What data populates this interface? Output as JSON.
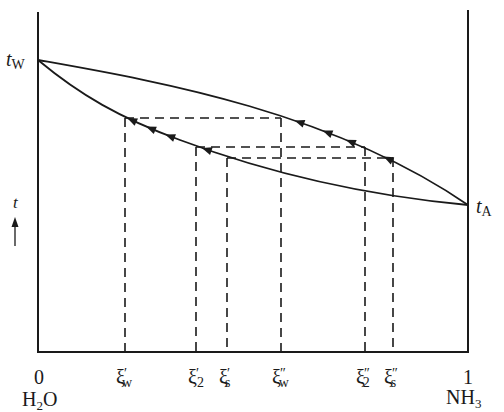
{
  "diagram": {
    "type": "temperature-composition phase diagram",
    "y_axis": {
      "symbol": "t",
      "direction": "increasing-up"
    },
    "left_end": {
      "value_label": "0",
      "component": "H",
      "component_sub": "2",
      "component_tail": "O",
      "temp_label": "t",
      "temp_sub": "W"
    },
    "right_end": {
      "value_label": "1",
      "component": "NH",
      "component_sub": "3",
      "temp_label": "t",
      "temp_sub": "A"
    },
    "curves": [
      {
        "name": "dew-point-curve",
        "position": "upper",
        "flow_direction": "toward-left"
      },
      {
        "name": "boiling-point-curve",
        "position": "lower",
        "flow_direction": "toward-left"
      }
    ],
    "tie_lines": [
      {
        "name": "w",
        "left": {
          "base": "ξ",
          "prime": "′",
          "sub": "w"
        },
        "right": {
          "base": "ξ",
          "prime": "″",
          "sub": "w"
        }
      },
      {
        "name": "2",
        "left": {
          "base": "ξ",
          "prime": "′",
          "sub": "2"
        },
        "right": {
          "base": "ξ",
          "prime": "″",
          "sub": "2"
        }
      },
      {
        "name": "s",
        "left": {
          "base": "ξ",
          "prime": "′",
          "sub": "s"
        },
        "right": {
          "base": "ξ",
          "prime": "″",
          "sub": "s"
        }
      }
    ],
    "composition_order": [
      "ξ′w",
      "ξ′2",
      "ξ′s",
      "ξ″w",
      "ξ″2",
      "ξ″s"
    ],
    "line_color": "#1a1a1a"
  }
}
